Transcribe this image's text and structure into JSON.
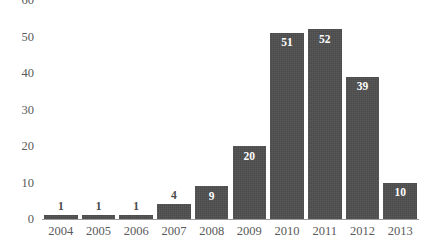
{
  "chart_data": {
    "type": "bar",
    "title": "",
    "subtitle": "",
    "xlabel": "",
    "ylabel": "",
    "categories": [
      "2004",
      "2005",
      "2006",
      "2007",
      "2008",
      "2009",
      "2010",
      "2011",
      "2012",
      "2013"
    ],
    "values": [
      1,
      1,
      1,
      4,
      9,
      20,
      51,
      52,
      39,
      10
    ],
    "data_labels": [
      "1",
      "1",
      "1",
      "4",
      "9",
      "20",
      "51",
      "52",
      "39",
      "10"
    ],
    "label_placement": [
      "outside",
      "outside",
      "outside",
      "outside",
      "inside",
      "inside",
      "inside",
      "inside",
      "inside",
      "inside"
    ],
    "ylim": [
      0,
      60
    ],
    "ytick_values": [
      0,
      10,
      20,
      30,
      40,
      50,
      60
    ],
    "ytick_labels": [
      "0",
      "10",
      "20",
      "30",
      "40",
      "50",
      "60"
    ],
    "grid": false,
    "legend": false,
    "legend_position": "none",
    "bar_color": "#4a4a4a",
    "inside_label_color": "#ffffff",
    "outside_label_color": "#4a4a4a",
    "axis_text_color": "#5a5a5a",
    "axis_line_color": "#9a9a9a",
    "background_color": "#ffffff"
  }
}
